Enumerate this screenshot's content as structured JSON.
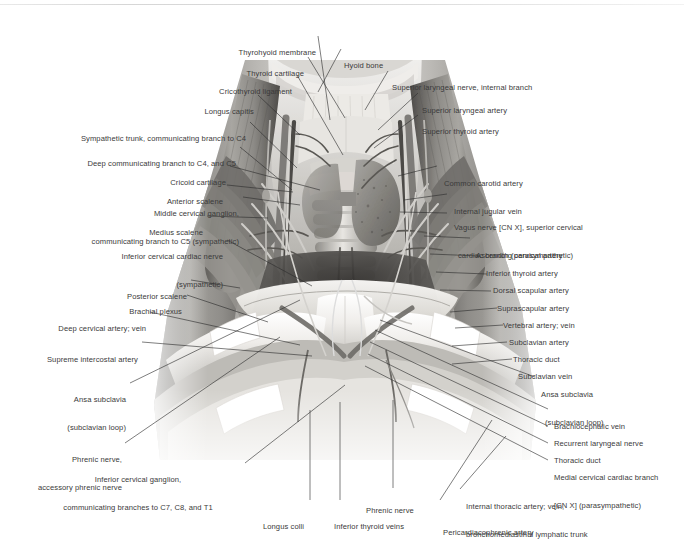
{
  "plate": {
    "title": "Root of the neck — anterior dissection",
    "background": "#ffffff",
    "text_color": "#3a3a3a",
    "leader_color": "#2e2e2e"
  },
  "labels_top": [
    {
      "id": "thyrohyoid-membrane",
      "text": "Thyrohyoid membrane"
    },
    {
      "id": "thyroid-cartilage",
      "text": "Thyroid cartilage"
    },
    {
      "id": "hyoid-bone",
      "text": "Hyoid bone"
    },
    {
      "id": "cricothyroid-ligament",
      "text": "Cricothyroid ligament"
    },
    {
      "id": "longus-capitis",
      "text": "Longus capitis"
    }
  ],
  "labels_left": [
    {
      "id": "sympathetic-trunk",
      "lines": [
        "Sympathetic trunk, communicating branch to C4"
      ]
    },
    {
      "id": "deep-communicating-branch",
      "lines": [
        "Deep communicating branch to C4, and C5"
      ]
    },
    {
      "id": "cricoid-cartilage",
      "lines": [
        "Cricoid cartilage"
      ]
    },
    {
      "id": "anterior-scalene",
      "lines": [
        "Anterior scalene"
      ]
    },
    {
      "id": "middle-cervical-ganglion",
      "lines": [
        "Middle cervical ganglion,",
        "communicating branch to C5 (sympathetic)"
      ]
    },
    {
      "id": "medius-scalene",
      "lines": [
        "Medius scalene"
      ]
    },
    {
      "id": "inferior-cervical-cardiac-nerve",
      "lines": [
        "Inferior cervical cardiac nerve",
        "(sympathetic)"
      ]
    },
    {
      "id": "posterior-scalene",
      "lines": [
        "Posterior scalene"
      ]
    },
    {
      "id": "brachial-plexus",
      "lines": [
        "Brachial plexus"
      ]
    },
    {
      "id": "deep-cervical-artery-vein",
      "lines": [
        "Deep cervical artery; vein"
      ]
    },
    {
      "id": "supreme-intercostal-artery",
      "lines": [
        "Supreme intercostal artery"
      ]
    },
    {
      "id": "ansa-subclavia-left",
      "lines": [
        "Ansa subclavia",
        "(subclavian loop)"
      ]
    },
    {
      "id": "phrenic-nerve-accessory",
      "lines": [
        "Phrenic nerve,",
        "accessory phrenic nerve"
      ]
    },
    {
      "id": "inferior-cervical-ganglion",
      "lines": [
        "Inferior cervical ganglion,",
        "communicating branches to C7, C8, and T1"
      ]
    }
  ],
  "labels_right": [
    {
      "id": "superior-laryngeal-nerve-internal-branch",
      "lines": [
        "Superior laryngeal nerve, internal branch"
      ]
    },
    {
      "id": "superior-laryngeal-artery",
      "lines": [
        "Superior laryngeal artery"
      ]
    },
    {
      "id": "superior-thyroid-artery",
      "lines": [
        "Superior thyroid artery"
      ]
    },
    {
      "id": "common-carotid-artery",
      "lines": [
        "Common carotid artery"
      ]
    },
    {
      "id": "internal-jugular-vein",
      "lines": [
        "Internal jugular vein"
      ]
    },
    {
      "id": "vagus-nerve",
      "lines": [
        "Vagus nerve [CN X], superior cervical",
        "cardiac branch (parasympathetic)"
      ]
    },
    {
      "id": "ascending-cervical-artery",
      "lines": [
        "Ascending cervical artery"
      ]
    },
    {
      "id": "inferior-thyroid-artery",
      "lines": [
        "Inferior thyroid artery"
      ]
    },
    {
      "id": "dorsal-scapular-artery",
      "lines": [
        "Dorsal scapular artery"
      ]
    },
    {
      "id": "suprascapular-artery",
      "lines": [
        "Suprascapular artery"
      ]
    },
    {
      "id": "vertebral-artery-vein",
      "lines": [
        "Vertebral artery; vein"
      ]
    },
    {
      "id": "subclavian-artery",
      "lines": [
        "Subclavian artery"
      ]
    },
    {
      "id": "thoracic-duct-upper",
      "lines": [
        "Thoracic duct"
      ]
    },
    {
      "id": "subclavian-vein",
      "lines": [
        "Subclavian vein"
      ]
    },
    {
      "id": "ansa-subclavia-right",
      "lines": [
        "Ansa subclavia",
        "(subclavian loop)"
      ]
    },
    {
      "id": "brachiocephalic-vein",
      "lines": [
        "Brachiocephalic vein"
      ]
    },
    {
      "id": "recurrent-laryngeal-nerve",
      "lines": [
        "Recurrent laryngeal nerve"
      ]
    },
    {
      "id": "thoracic-duct-lower",
      "lines": [
        "Thoracic duct"
      ]
    },
    {
      "id": "medial-cervical-cardiac-branch",
      "lines": [
        "Medial cervical cardiac branch",
        "[CN X] (parasympathetic)"
      ]
    }
  ],
  "labels_bottom": [
    {
      "id": "longus-colli",
      "lines": [
        "Longus colli"
      ]
    },
    {
      "id": "inferior-thyroid-veins",
      "lines": [
        "Inferior thyroid veins"
      ]
    },
    {
      "id": "phrenic-nerve",
      "lines": [
        "Phrenic nerve"
      ]
    },
    {
      "id": "pericardiacophrenic-artery",
      "lines": [
        "Pericardiacophrenic artery"
      ]
    },
    {
      "id": "internal-thoracic",
      "lines": [
        "Internal thoracic artery; vein,",
        "bronchomediastinal lymphatic trunk"
      ]
    }
  ]
}
